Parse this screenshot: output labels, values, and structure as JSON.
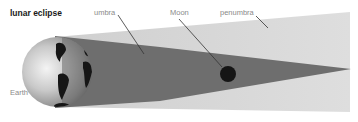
{
  "title": "lunar eclipse",
  "labels": {
    "umbra": "umbra",
    "moon": "Moon",
    "penumbra": "penumbra",
    "earth": "Earth"
  },
  "colors": {
    "penumbra": "#d9d9d9",
    "umbra": "#6e6e6e",
    "moon": "#151515",
    "label_text": "#8a8a8a",
    "title_text": "#1a1a1a",
    "leader_line": "#333333"
  }
}
